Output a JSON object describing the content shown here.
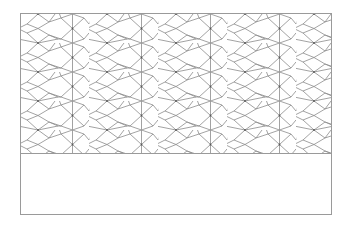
{
  "canvas": {
    "width": 350,
    "height": 225,
    "background": "#ffffff"
  },
  "frame": {
    "border_color": "#9a9a9a"
  },
  "pattern": {
    "type": "pinwheel-rhombus-tiling",
    "line_color": "#8a8a8a",
    "vertex_color": "#555555",
    "period_x": 69,
    "period_y": 29
  },
  "blank_panel": {
    "text": ""
  }
}
